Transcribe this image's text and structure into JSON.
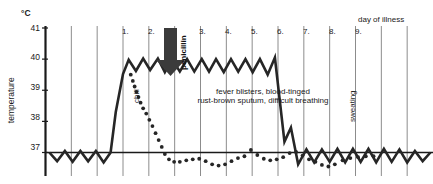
{
  "chart_data": {
    "type": "line",
    "title": "",
    "xlabel": "day of illness",
    "ylabel": "temperature",
    "unit": "°C",
    "ylim": [
      36.3,
      41.3
    ],
    "yticks": [
      41,
      40,
      39,
      38,
      37
    ],
    "ytick_labels": [
      "41",
      "40",
      "39",
      "38",
      "37"
    ],
    "xlim": [
      0,
      15
    ],
    "xticks": [
      1,
      2,
      3,
      4,
      5,
      6,
      7,
      8,
      9
    ],
    "xtick_labels": [
      "1.",
      "2.",
      "3.",
      "4.",
      "5.",
      "6.",
      "7.",
      "8.",
      "9."
    ],
    "grid": true,
    "legend": "none",
    "baseline_value": 37,
    "series": [
      {
        "name": "untreated-fever-course",
        "style": "solid",
        "color": "#262626",
        "points": [
          [
            0.15,
            37.0
          ],
          [
            0.45,
            36.72
          ],
          [
            0.75,
            37.05
          ],
          [
            1.05,
            36.7
          ],
          [
            1.35,
            37.05
          ],
          [
            1.65,
            36.72
          ],
          [
            1.95,
            37.05
          ],
          [
            2.25,
            36.68
          ],
          [
            2.52,
            37.0
          ],
          [
            2.72,
            38.3
          ],
          [
            3.0,
            39.52
          ],
          [
            3.22,
            39.98
          ],
          [
            3.5,
            39.62
          ],
          [
            3.78,
            40.02
          ],
          [
            4.05,
            39.65
          ],
          [
            4.35,
            40.02
          ],
          [
            4.62,
            39.58
          ],
          [
            4.9,
            40.0
          ],
          [
            5.2,
            39.6
          ],
          [
            5.48,
            40.0
          ],
          [
            5.76,
            39.6
          ],
          [
            6.05,
            40.0
          ],
          [
            6.33,
            39.6
          ],
          [
            6.6,
            40.0
          ],
          [
            6.9,
            39.58
          ],
          [
            7.18,
            40.0
          ],
          [
            7.46,
            39.6
          ],
          [
            7.74,
            40.0
          ],
          [
            8.02,
            39.58
          ],
          [
            8.3,
            40.0
          ],
          [
            8.6,
            39.5
          ],
          [
            8.88,
            40.05
          ],
          [
            9.25,
            37.35
          ],
          [
            9.5,
            37.8
          ],
          [
            9.78,
            36.62
          ],
          [
            10.1,
            37.1
          ],
          [
            10.4,
            36.68
          ],
          [
            10.7,
            37.1
          ],
          [
            11.0,
            36.7
          ],
          [
            11.3,
            37.12
          ],
          [
            11.6,
            36.68
          ],
          [
            11.9,
            37.12
          ],
          [
            12.2,
            36.7
          ],
          [
            12.5,
            37.12
          ],
          [
            12.8,
            36.68
          ],
          [
            13.1,
            37.12
          ],
          [
            13.4,
            36.7
          ],
          [
            13.7,
            37.1
          ],
          [
            14.0,
            36.68
          ],
          [
            14.3,
            37.05
          ],
          [
            14.6,
            36.72
          ],
          [
            14.9,
            37.0
          ]
        ]
      },
      {
        "name": "penicillin-treated-course",
        "style": "dotted",
        "color": "#262626",
        "points": [
          [
            3.3,
            39.5
          ],
          [
            3.38,
            39.3
          ],
          [
            3.45,
            39.12
          ],
          [
            3.52,
            38.95
          ],
          [
            3.6,
            38.78
          ],
          [
            3.68,
            38.6
          ],
          [
            3.78,
            38.42
          ],
          [
            3.9,
            38.25
          ],
          [
            4.02,
            38.05
          ],
          [
            4.14,
            37.85
          ],
          [
            4.26,
            37.62
          ],
          [
            4.38,
            37.4
          ],
          [
            4.5,
            37.18
          ],
          [
            4.62,
            36.95
          ],
          [
            4.78,
            36.78
          ],
          [
            4.98,
            36.7
          ],
          [
            5.2,
            36.7
          ],
          [
            5.45,
            36.75
          ],
          [
            5.7,
            36.78
          ],
          [
            5.95,
            36.8
          ],
          [
            6.2,
            36.72
          ],
          [
            6.45,
            36.62
          ],
          [
            6.7,
            36.58
          ],
          [
            6.95,
            36.62
          ],
          [
            7.2,
            36.72
          ],
          [
            7.45,
            36.82
          ],
          [
            7.7,
            36.88
          ],
          [
            7.95,
            37.08
          ],
          [
            8.2,
            36.92
          ],
          [
            8.45,
            36.8
          ],
          [
            8.7,
            36.75
          ],
          [
            8.95,
            36.78
          ],
          [
            9.2,
            36.85
          ],
          [
            9.45,
            36.98
          ],
          [
            9.7,
            37.02
          ],
          [
            9.95,
            36.9
          ],
          [
            10.2,
            36.78
          ],
          [
            10.45,
            36.7
          ],
          [
            10.7,
            36.6
          ],
          [
            10.95,
            36.55
          ],
          [
            11.2,
            36.62
          ],
          [
            11.5,
            36.75
          ],
          [
            11.8,
            36.82
          ],
          [
            12.1,
            36.85
          ],
          [
            12.4,
            36.88
          ],
          [
            12.7,
            36.88
          ]
        ]
      }
    ],
    "annotations": [
      {
        "name": "chill",
        "text": "chill",
        "orientation": "vertical"
      },
      {
        "name": "penicillin",
        "text": "penicillin",
        "orientation": "vertical"
      },
      {
        "name": "sweating",
        "text": "sweating",
        "orientation": "vertical"
      },
      {
        "name": "symptoms-line-1",
        "text": "fever blisters, blood-tinged"
      },
      {
        "name": "symptoms-line-2",
        "text": "rust-brown sputum, difficult breathing"
      }
    ],
    "arrow": {
      "name": "penicillin-arrow",
      "direction": "down",
      "day": 2.55
    }
  },
  "labels": {
    "unit": "°C",
    "y_axis_title": "temperature",
    "x_axis_title": "day of illness",
    "yticks": [
      "41",
      "40",
      "39",
      "38",
      "37"
    ],
    "days": [
      "1.",
      "2.",
      "3.",
      "4.",
      "5.",
      "6.",
      "7.",
      "8.",
      "9."
    ],
    "chill": "chill",
    "penicillin": "penicillin",
    "sweating": "sweating",
    "symptoms_1": "fever blisters, blood-tinged",
    "symptoms_2": "rust-brown sputum, difficult breathing"
  },
  "colors": {
    "line": "#262626",
    "grid": "#8c8c8c",
    "axis": "#1a1a1a",
    "background": "#ffffff"
  }
}
